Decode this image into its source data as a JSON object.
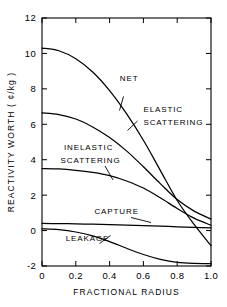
{
  "chart_data": {
    "type": "line",
    "title": "",
    "xlabel": "FRACTIONAL RADIUS",
    "ylabel": "REACTIVITY WORTH  ( ¢/kg )",
    "xlim": [
      0,
      1.0
    ],
    "ylim": [
      -2,
      12
    ],
    "grid": false,
    "legend_position": "inline-annotations",
    "xticks": [
      "0",
      "0.2",
      "0.4",
      "0.6",
      "0.8",
      "1.0"
    ],
    "xtick_values": [
      0,
      0.2,
      0.4,
      0.6,
      0.8,
      1.0
    ],
    "yticks": [
      "12",
      "10",
      "8",
      "6",
      "4",
      "2",
      "0",
      "-2"
    ],
    "ytick_values": [
      12,
      10,
      8,
      6,
      4,
      2,
      0,
      -2
    ],
    "x": [
      0,
      0.1,
      0.2,
      0.3,
      0.4,
      0.5,
      0.6,
      0.7,
      0.8,
      0.9,
      1.0
    ],
    "series": [
      {
        "name": "NET",
        "label": "NET",
        "values": [
          10.3,
          10.15,
          9.7,
          8.95,
          7.9,
          6.6,
          5.1,
          3.4,
          1.7,
          0.35,
          -0.85
        ]
      },
      {
        "name": "ELASTIC SCATTERING",
        "label": "ELASTIC SCATTERING",
        "values": [
          6.65,
          6.55,
          6.3,
          5.85,
          5.25,
          4.5,
          3.6,
          2.65,
          1.75,
          1.1,
          0.65
        ]
      },
      {
        "name": "INELASTIC SCATTERING",
        "label": "INELASTIC SCATTERING",
        "values": [
          3.5,
          3.48,
          3.4,
          3.28,
          3.1,
          2.8,
          2.4,
          1.85,
          1.25,
          0.7,
          0.3
        ]
      },
      {
        "name": "CAPTURE",
        "label": "CAPTURE",
        "values": [
          0.4,
          0.39,
          0.38,
          0.36,
          0.34,
          0.31,
          0.28,
          0.25,
          0.21,
          0.18,
          0.15
        ]
      },
      {
        "name": "LEAKAGE",
        "label": "LEAKAGE",
        "values": [
          0.1,
          0.05,
          -0.08,
          -0.3,
          -0.62,
          -1.0,
          -1.35,
          -1.62,
          -1.79,
          -1.85,
          -1.86
        ]
      }
    ],
    "annotations": [
      {
        "text": "NET",
        "x": 0.46,
        "y": 8.45
      },
      {
        "text": "ELASTIC",
        "x": 0.6,
        "y": 6.7
      },
      {
        "text": "SCATTERING",
        "x": 0.6,
        "y": 5.95
      },
      {
        "text": "INELASTIC",
        "x": 0.13,
        "y": 4.55
      },
      {
        "text": "SCATTERING",
        "x": 0.11,
        "y": 3.8
      },
      {
        "text": "CAPTURE",
        "x": 0.31,
        "y": 0.95
      },
      {
        "text": "LEAKAGE",
        "x": 0.14,
        "y": -0.6
      }
    ]
  }
}
